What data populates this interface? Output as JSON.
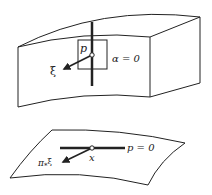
{
  "diagram": {
    "top_figure": {
      "point_label": "p",
      "vector_label": "ξ",
      "plane_label": "α = 0"
    },
    "bottom_figure": {
      "point_label": "x",
      "vector_label": "π",
      "vector_label_sub": "*",
      "vector_label_tail": "ξ",
      "line_label": "p = 0"
    },
    "colors": {
      "stroke": "#222222",
      "background": "#ffffff"
    }
  }
}
